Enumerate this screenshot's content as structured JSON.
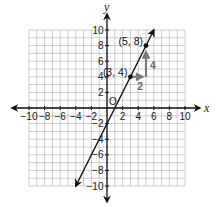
{
  "chart_data": {
    "type": "line",
    "title": "",
    "xlabel": "x",
    "ylabel": "y",
    "xlim": [
      -10,
      10
    ],
    "ylim": [
      -10,
      10
    ],
    "grid": true,
    "origin_label": "O",
    "x_ticks": [
      -10,
      -8,
      -6,
      -4,
      -2,
      2,
      4,
      6,
      8,
      10
    ],
    "y_ticks": [
      -10,
      -8,
      -6,
      -4,
      -2,
      2,
      4,
      6,
      8,
      10
    ],
    "x_tick_labels": [
      "−10",
      "−8",
      "−6",
      "−4",
      "−2",
      "2",
      "4",
      "6",
      "8",
      "10"
    ],
    "y_tick_labels": [
      "−10",
      "−8",
      "−6",
      "−4",
      "−2",
      "2",
      "4",
      "6",
      "8",
      "10"
    ],
    "series": [
      {
        "name": "line",
        "equation": "y = 2x - 2",
        "slope": 2,
        "y_intercept": -2,
        "x": [
          -4,
          6
        ],
        "y": [
          -10,
          10
        ],
        "arrows_both_ends": true
      }
    ],
    "points": [
      {
        "x": 3,
        "y": 4,
        "label": "(3, 4)"
      },
      {
        "x": 5,
        "y": 8,
        "label": "(5, 8)"
      }
    ],
    "annotations": [
      {
        "type": "run-arrow",
        "from": [
          3,
          4
        ],
        "to": [
          5,
          4
        ],
        "label": "2"
      },
      {
        "type": "rise-arrow",
        "from": [
          5,
          4
        ],
        "to": [
          5,
          8
        ],
        "label": "4"
      }
    ],
    "colors": {
      "axis": "#111111",
      "grid": "#b8b8b8",
      "line": "#111111",
      "annotation": "#7a7a7a"
    }
  }
}
